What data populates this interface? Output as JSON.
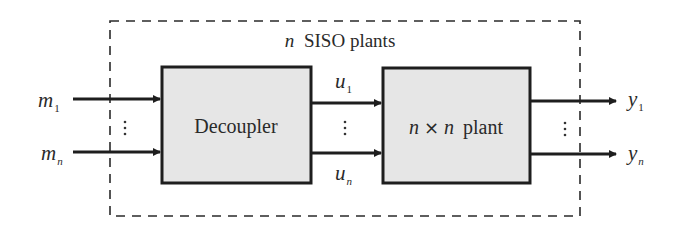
{
  "diagram": {
    "title": "n SISO plants",
    "title_var": "n",
    "title_text": "SISO plants",
    "blocks": [
      {
        "id": "decoupler",
        "label": "Decoupler"
      },
      {
        "id": "plant",
        "label_var1": "n",
        "label_op": "×",
        "label_var2": "n",
        "label_text": "plant",
        "label": "n×n plant"
      }
    ],
    "inputs": [
      {
        "base": "m",
        "sub": "1"
      },
      {
        "base": "m",
        "sub": "n"
      }
    ],
    "intermediate": [
      {
        "base": "u",
        "sub": "1"
      },
      {
        "base": "u",
        "sub": "n"
      }
    ],
    "outputs": [
      {
        "base": "y",
        "sub": "1"
      },
      {
        "base": "y",
        "sub": "n"
      }
    ],
    "ellipsis": "⋮",
    "enclosure": {
      "style": "dashed",
      "label": "n SISO plants"
    },
    "colors": {
      "block_fill": "#e6e6e6",
      "stroke": "#1e1e1e",
      "text": "#2a2a2a",
      "background": "#ffffff"
    }
  }
}
